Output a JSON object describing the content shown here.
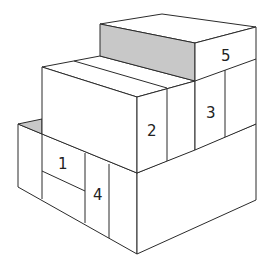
{
  "diagram": {
    "type": "isometric-stacked-boxes",
    "colors": {
      "stroke": "#2b2b2b",
      "face": "#ffffff",
      "shaded_face": "#c8c8c8",
      "label": "#222222"
    },
    "labels": [
      {
        "id": "1",
        "text": "1"
      },
      {
        "id": "2",
        "text": "2"
      },
      {
        "id": "3",
        "text": "3"
      },
      {
        "id": "4",
        "text": "4"
      },
      {
        "id": "5",
        "text": "5"
      }
    ]
  }
}
